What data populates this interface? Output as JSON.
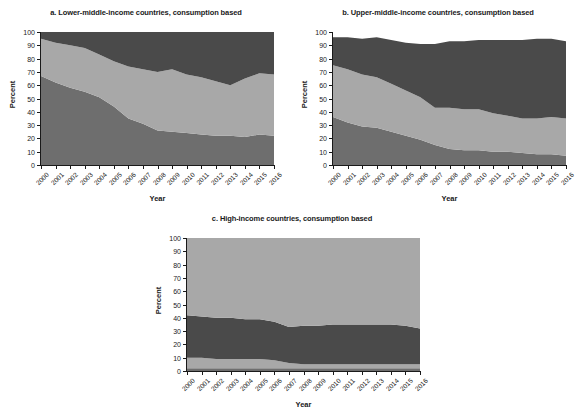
{
  "figure": {
    "ylabel": "Percent",
    "xlabel": "Year",
    "ylim": [
      0,
      100
    ],
    "yticks": [
      0,
      10,
      20,
      30,
      40,
      50,
      60,
      70,
      80,
      90,
      100
    ],
    "colors": {
      "band_bottom": "#6e6e6e",
      "band_middle": "#a8a8a8",
      "band_top": "#4a4a4a",
      "axis": "#1a1a1a",
      "background": "#ffffff"
    }
  },
  "chart_data": [
    {
      "id": "panel-a",
      "type": "area",
      "stacked": true,
      "title": "a. Lower-middle-income countries, consumption based",
      "xlabel": "Year",
      "ylabel": "Percent",
      "ylim": [
        0,
        100
      ],
      "grid": false,
      "legend": "none",
      "x": [
        2000,
        2001,
        2002,
        2003,
        2004,
        2005,
        2006,
        2007,
        2008,
        2009,
        2010,
        2011,
        2012,
        2013,
        2014,
        2015,
        2016
      ],
      "categories": [
        "2000",
        "2001",
        "2002",
        "2003",
        "2004",
        "2005",
        "2006",
        "2007",
        "2008",
        "2009",
        "2010",
        "2011",
        "2012",
        "2013",
        "2014",
        "2015",
        "2016"
      ],
      "series": [
        {
          "name": "bottom-band",
          "color": "#6e6e6e",
          "values": [
            67,
            62,
            58,
            55,
            51,
            44,
            35,
            31,
            26,
            25,
            24,
            23,
            22,
            22,
            21,
            23,
            22
          ]
        },
        {
          "name": "middle-band",
          "color": "#a8a8a8",
          "values": [
            28,
            30,
            32,
            33,
            32,
            34,
            39,
            41,
            44,
            47,
            44,
            43,
            41,
            38,
            44,
            46,
            46
          ]
        },
        {
          "name": "top-band",
          "color": "#4a4a4a",
          "values": [
            5,
            8,
            10,
            12,
            17,
            22,
            26,
            28,
            30,
            28,
            32,
            34,
            37,
            40,
            35,
            31,
            32
          ]
        }
      ],
      "cumulative_upper_bounds": {
        "bottom_top_edge": [
          67,
          62,
          58,
          55,
          51,
          44,
          35,
          31,
          26,
          25,
          24,
          23,
          22,
          22,
          21,
          23,
          22
        ],
        "middle_top_edge": [
          95,
          92,
          90,
          88,
          83,
          78,
          74,
          72,
          70,
          72,
          68,
          66,
          63,
          60,
          65,
          69,
          68
        ]
      }
    },
    {
      "id": "panel-b",
      "type": "area",
      "stacked": true,
      "title": "b. Upper-middle-income countries, consumption based",
      "xlabel": "Year",
      "ylabel": "Percent",
      "ylim": [
        0,
        100
      ],
      "grid": false,
      "legend": "none",
      "x": [
        2000,
        2001,
        2002,
        2003,
        2004,
        2005,
        2006,
        2007,
        2008,
        2009,
        2010,
        2011,
        2012,
        2013,
        2014,
        2015,
        2016
      ],
      "categories": [
        "2000",
        "2001",
        "2002",
        "2003",
        "2004",
        "2005",
        "2006",
        "2007",
        "2008",
        "2009",
        "2010",
        "2011",
        "2012",
        "2013",
        "2014",
        "2015",
        "2016"
      ],
      "series": [
        {
          "name": "bottom-band",
          "color": "#6e6e6e",
          "values": [
            36,
            32,
            29,
            28,
            25,
            22,
            19,
            15,
            12,
            11,
            11,
            10,
            10,
            9,
            8,
            8,
            7
          ]
        },
        {
          "name": "middle-band",
          "color": "#a8a8a8",
          "values": [
            39,
            40,
            39,
            38,
            36,
            34,
            32,
            28,
            31,
            31,
            31,
            29,
            27,
            26,
            27,
            28,
            28
          ]
        },
        {
          "name": "top-band",
          "color": "#4a4a4a",
          "values": [
            21,
            24,
            27,
            30,
            33,
            36,
            40,
            48,
            50,
            51,
            52,
            55,
            57,
            59,
            60,
            59,
            58
          ]
        }
      ],
      "cumulative_upper_bounds": {
        "bottom_top_edge": [
          36,
          32,
          29,
          28,
          25,
          22,
          19,
          15,
          12,
          11,
          11,
          10,
          10,
          9,
          8,
          8,
          7
        ],
        "middle_top_edge": [
          75,
          72,
          68,
          66,
          61,
          56,
          51,
          43,
          43,
          42,
          42,
          39,
          37,
          35,
          35,
          36,
          35
        ]
      }
    },
    {
      "id": "panel-c",
      "type": "area",
      "stacked": true,
      "title": "c. High-income countries, consumption based",
      "xlabel": "Year",
      "ylabel": "Percent",
      "ylim": [
        0,
        100
      ],
      "grid": false,
      "legend": "none",
      "x": [
        2000,
        2001,
        2002,
        2003,
        2004,
        2005,
        2006,
        2007,
        2008,
        2009,
        2010,
        2011,
        2012,
        2013,
        2014,
        2015,
        2016
      ],
      "categories": [
        "2000",
        "2001",
        "2002",
        "2003",
        "2004",
        "2005",
        "2006",
        "2007",
        "2008",
        "2009",
        "2010",
        "2011",
        "2012",
        "2013",
        "2014",
        "2015",
        "2016"
      ],
      "series": [
        {
          "name": "bottom-band",
          "color": "#6e6e6e",
          "values": [
            2,
            2,
            2,
            2,
            2,
            2,
            2,
            2,
            2,
            2,
            2,
            2,
            2,
            2,
            2,
            2,
            2
          ]
        },
        {
          "name": "middle-band",
          "color": "#a8a8a8",
          "values": [
            8,
            8,
            7,
            7,
            7,
            7,
            6,
            4,
            3,
            3,
            3,
            3,
            3,
            3,
            3,
            3,
            3
          ]
        },
        {
          "name": "top-band",
          "color": "#4a4a4a",
          "values": [
            32,
            31,
            31,
            31,
            30,
            30,
            29,
            27,
            29,
            29,
            30,
            30,
            30,
            30,
            30,
            29,
            27
          ]
        },
        {
          "name": "remainder-band",
          "color": "#a8a8a8",
          "values": [
            58,
            59,
            60,
            60,
            61,
            61,
            63,
            67,
            66,
            66,
            65,
            65,
            65,
            65,
            65,
            66,
            68
          ]
        }
      ],
      "cumulative_upper_bounds": {
        "bottom_top_edge": [
          2,
          2,
          2,
          2,
          2,
          2,
          2,
          2,
          2,
          2,
          2,
          2,
          2,
          2,
          2,
          2,
          2
        ],
        "middle_top_edge": [
          10,
          10,
          9,
          9,
          9,
          9,
          8,
          6,
          5,
          5,
          5,
          5,
          5,
          5,
          5,
          5,
          5
        ],
        "top_top_edge": [
          42,
          41,
          40,
          40,
          39,
          39,
          37,
          33,
          34,
          34,
          35,
          35,
          35,
          35,
          35,
          34,
          32
        ]
      }
    }
  ]
}
